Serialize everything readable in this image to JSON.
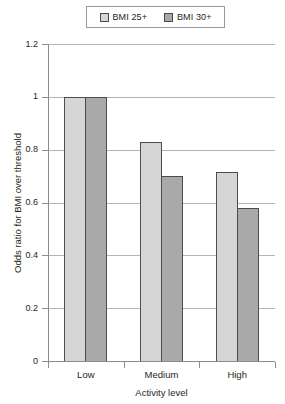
{
  "chart_data": {
    "type": "bar",
    "title": "",
    "subtitle": "",
    "xlabel": "Activity level",
    "ylabel": "Odds ratio for BMI over threshold",
    "categories": [
      "Low",
      "Medium",
      "High"
    ],
    "series": [
      {
        "name": "BMI 25+",
        "color": "#d6d6d6",
        "values": [
          1.0,
          0.83,
          0.715
        ]
      },
      {
        "name": "BMI 30+",
        "color": "#a9a9a9",
        "values": [
          1.0,
          0.7,
          0.58
        ]
      }
    ],
    "ylim": [
      0,
      1.2
    ],
    "ytick_labels": [
      "0",
      "0.2",
      "0.4",
      "0.6",
      "0.8",
      "1",
      "1.2"
    ],
    "ytick_values": [
      0,
      0.2,
      0.4,
      0.6,
      0.8,
      1,
      1.2
    ],
    "grid": true,
    "grid_axis": "y",
    "legend_position": "top",
    "bar_outline_color": "#4d4d4d",
    "axis_color": "#8c8c8c",
    "gridline_color": "#b5b5b5"
  },
  "legend": {
    "items": [
      {
        "label": "BMI 25+",
        "swatch_name": "legend-swatch-bmi-25"
      },
      {
        "label": "BMI 30+",
        "swatch_name": "legend-swatch-bmi-30"
      }
    ]
  },
  "axes": {
    "y_title": "Odds ratio for BMI over threshold",
    "x_title": "Activity level",
    "y_labels": [
      "1.2",
      "1",
      "0.8",
      "0.6",
      "0.4",
      "0.2",
      "0"
    ],
    "x_labels": [
      "Low",
      "Medium",
      "High"
    ]
  }
}
